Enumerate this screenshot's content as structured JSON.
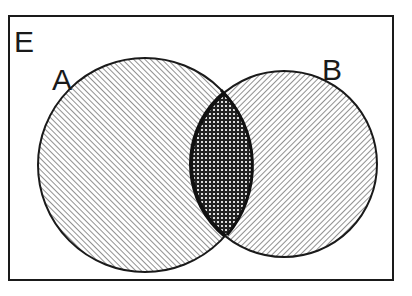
{
  "diagram": {
    "type": "venn",
    "universe_label": "E",
    "sets": [
      {
        "label": "A",
        "pattern": "diagonal-hatch"
      },
      {
        "label": "B",
        "pattern": "diagonal-hatch-reverse"
      }
    ],
    "intersection": {
      "sets": [
        "A",
        "B"
      ],
      "pattern": "cross-hatch",
      "highlighted": true
    }
  },
  "colors": {
    "background": "#ffffff",
    "line": "#1a1a1a",
    "hatch": "#555555"
  }
}
